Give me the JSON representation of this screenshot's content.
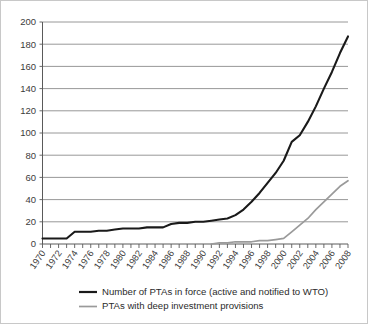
{
  "chart_data": {
    "type": "line",
    "title": "",
    "subtitle": "",
    "xlabel": "",
    "ylabel": "",
    "xlim": [
      1970,
      2008
    ],
    "ylim": [
      0,
      200
    ],
    "grid": true,
    "legend_position": "bottom",
    "y_ticks": [
      0,
      20,
      40,
      60,
      80,
      100,
      120,
      140,
      160,
      180,
      200
    ],
    "y_tick_labels": [
      "0",
      "20",
      "40",
      "60",
      "80",
      "100",
      "120",
      "140",
      "160",
      "180",
      "200"
    ],
    "x_ticks": [
      1970,
      1971,
      1972,
      1973,
      1974,
      1975,
      1976,
      1977,
      1978,
      1979,
      1980,
      1981,
      1982,
      1983,
      1984,
      1985,
      1986,
      1987,
      1988,
      1989,
      1990,
      1991,
      1992,
      1993,
      1994,
      1995,
      1996,
      1997,
      1998,
      1999,
      2000,
      2001,
      2002,
      2003,
      2004,
      2005,
      2006,
      2007,
      2008
    ],
    "x_tick_labels": [
      "1970",
      "1972",
      "1974",
      "1976",
      "1978",
      "1980",
      "1982",
      "1984",
      "1986",
      "1988",
      "1990",
      "1992",
      "1994",
      "1996",
      "1998",
      "2000",
      "2002",
      "2004",
      "2006",
      "2008"
    ],
    "x_tick_label_years": [
      1970,
      1972,
      1974,
      1976,
      1978,
      1980,
      1982,
      1984,
      1986,
      1988,
      1990,
      1992,
      1994,
      1996,
      1998,
      2000,
      2002,
      2004,
      2006,
      2008
    ],
    "x": [
      1970,
      1971,
      1972,
      1973,
      1974,
      1975,
      1976,
      1977,
      1978,
      1979,
      1980,
      1981,
      1982,
      1983,
      1984,
      1985,
      1986,
      1987,
      1988,
      1989,
      1990,
      1991,
      1992,
      1993,
      1994,
      1995,
      1996,
      1997,
      1998,
      1999,
      2000,
      2001,
      2002,
      2003,
      2004,
      2005,
      2006,
      2007,
      2008
    ],
    "series": [
      {
        "name": "Number of PTAs in force (active and notified to WTO)",
        "color": "#1a1a1a",
        "values": [
          5,
          5,
          5,
          5,
          11,
          11,
          11,
          12,
          12,
          13,
          14,
          14,
          14,
          15,
          15,
          15,
          18,
          19,
          19,
          20,
          20,
          21,
          22,
          23,
          26,
          31,
          38,
          46,
          55,
          64,
          75,
          92,
          98,
          110,
          124,
          140,
          155,
          172,
          187
        ]
      },
      {
        "name": "PTAs with deep investment provisions",
        "color": "#9a9a9a",
        "values": [
          0,
          0,
          0,
          0,
          0,
          0,
          0,
          0,
          0,
          0,
          0,
          0,
          0,
          0,
          0,
          0,
          0,
          0,
          0,
          0,
          0,
          0,
          1,
          1,
          2,
          2,
          2,
          3,
          3,
          4,
          5,
          11,
          17,
          23,
          31,
          38,
          45,
          52,
          57
        ]
      }
    ],
    "legend": [
      {
        "label": "Number of PTAs in force (active and notified to WTO)",
        "color": "#1a1a1a",
        "style": "dark-line"
      },
      {
        "label": "PTAs with deep investment provisions",
        "color": "#9a9a9a",
        "style": "grey-line"
      }
    ]
  },
  "colors": {
    "dark_series": "#1a1a1a",
    "grey_series": "#9a9a9a",
    "gridline": "#8c8c8c",
    "axis": "#5a5a5a",
    "text": "#3b3b3b",
    "background": "#ffffff",
    "frame_border": "#c8c8c8"
  }
}
